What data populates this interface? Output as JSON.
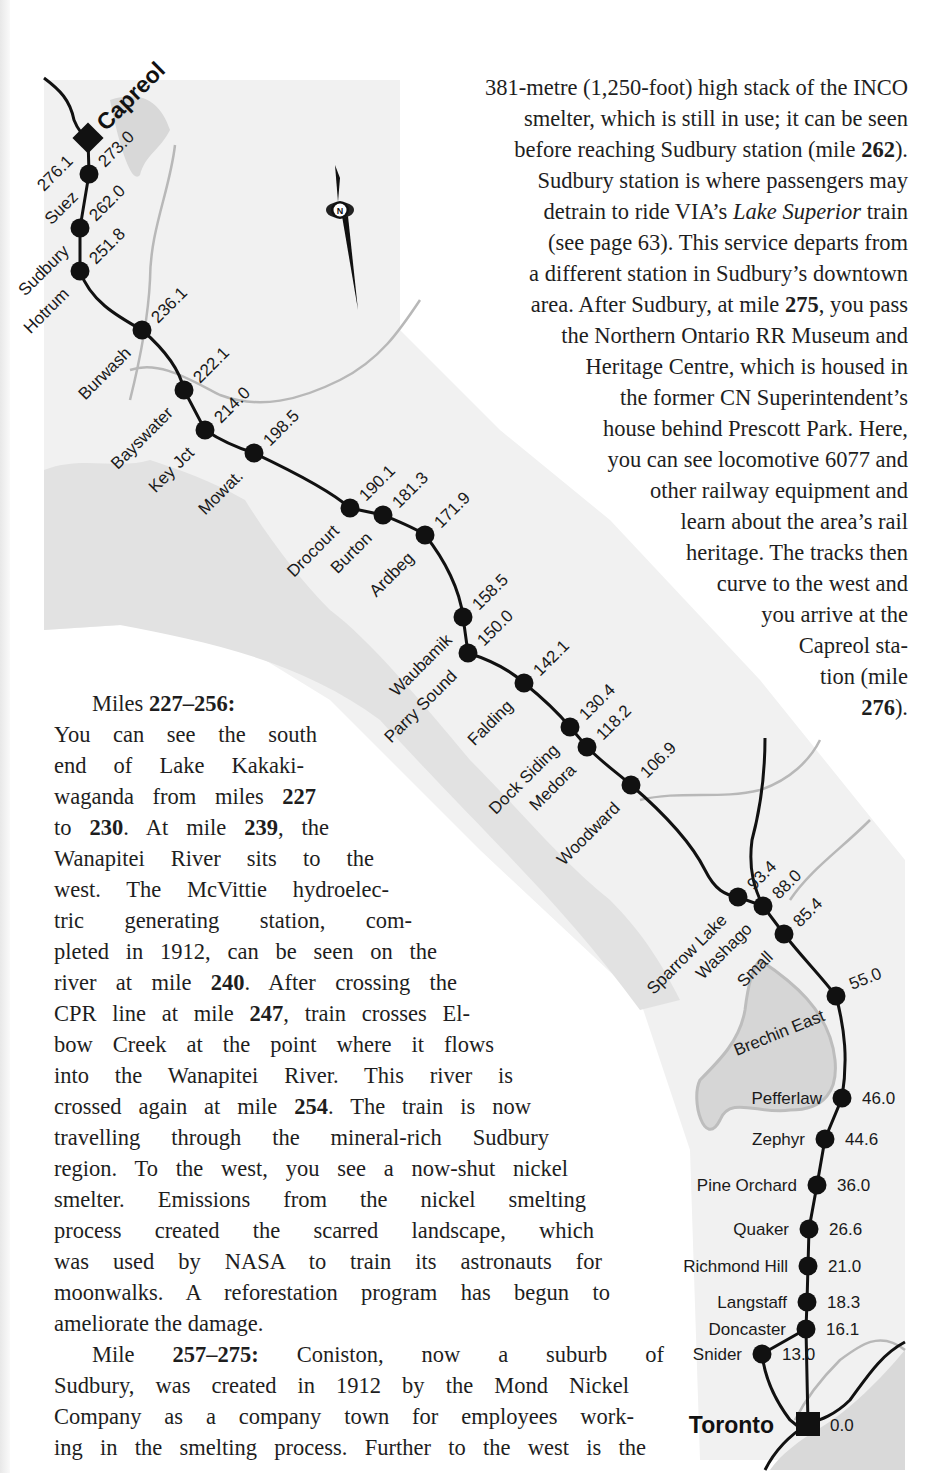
{
  "page": {
    "right_column": {
      "lines": [
        "381-metre (1,250-foot) high stack of the INCO",
        "smelter, which is still in use; it can be seen",
        [
          "before reaching Sudbury station (mile ",
          {
            "b": "262"
          },
          ")."
        ],
        "Sudbury station is where passengers may",
        [
          "detrain to ride VIA’s ",
          {
            "i": "Lake Superior"
          },
          " train"
        ],
        "(see page 63). This service departs from",
        "a different station in Sudbury’s downtown",
        [
          "area. After Sudbury, at mile ",
          {
            "b": "275"
          },
          ", you pass"
        ],
        "the Northern Ontario RR Museum and",
        "Heritage Centre, which is housed in",
        "the former CN Superintendent’s",
        "house behind Prescott Park. Here,",
        "you can see locomotive 6077 and",
        "other railway equipment and",
        "learn about the area’s rail",
        "heritage. The tracks then",
        "curve to the west and",
        "you arrive at the",
        "Capreol sta-",
        "tion (mile",
        [
          {
            "b": "276"
          },
          ")."
        ]
      ]
    },
    "left_column": {
      "lines": [
        {
          "indent": true,
          "parts": [
            "Miles ",
            {
              "b": "227–256:"
            }
          ],
          "last": true
        },
        {
          "parts": [
            "You can see the south"
          ],
          "width": 263
        },
        {
          "parts": [
            "end of Lake Kakaki-"
          ],
          "width": 250
        },
        {
          "parts": [
            "waganda from miles ",
            {
              "b": "227"
            }
          ],
          "width": 262
        },
        {
          "parts": [
            "to ",
            {
              "b": "230"
            },
            ". At mile ",
            {
              "b": "239"
            },
            ", the"
          ],
          "width": 275
        },
        {
          "parts": [
            "Wanapitei River sits to the"
          ],
          "width": 320
        },
        {
          "parts": [
            "west. The McVittie hydroelec-"
          ],
          "width": 335
        },
        {
          "parts": [
            "tric generating station, com-"
          ],
          "width": 358
        },
        {
          "parts": [
            "pleted in 1912, can be seen on the"
          ],
          "width": 383
        },
        {
          "parts": [
            "river at mile ",
            {
              "b": "240"
            },
            ". After crossing the"
          ],
          "width": 403
        },
        {
          "parts": [
            "CPR line at mile ",
            {
              "b": "247"
            },
            ", train crosses El-"
          ],
          "width": 416
        },
        {
          "parts": [
            "bow Creek at the point where it flows"
          ],
          "width": 440
        },
        {
          "parts": [
            "into the Wanapitei River. This river is"
          ],
          "width": 459
        },
        {
          "parts": [
            "crossed again at mile ",
            {
              "b": "254"
            },
            ". The train is now"
          ],
          "width": 477
        },
        {
          "parts": [
            "travelling through the mineral-rich Sudbury"
          ],
          "width": 495
        },
        {
          "parts": [
            "region. To the west, you see a now-shut nickel"
          ],
          "width": 514
        },
        {
          "parts": [
            "smelter. Emissions from the nickel smelting"
          ],
          "width": 532
        },
        {
          "parts": [
            "process created the scarred landscape, which"
          ],
          "width": 540
        },
        {
          "parts": [
            "was used by NASA to train its astronauts for"
          ],
          "width": 548
        },
        {
          "parts": [
            "moonwalks. A reforestation program has begun to"
          ],
          "width": 556
        },
        {
          "parts": [
            "ameliorate the damage."
          ],
          "last": true
        },
        {
          "indent": true,
          "parts": [
            "Mile ",
            {
              "b": "257–275:"
            },
            " Coniston, now a suburb of"
          ],
          "width": 572
        },
        {
          "parts": [
            "Sudbury, was created in 1912 by the Mond Nickel"
          ],
          "width": 575
        },
        {
          "parts": [
            "Company as a company town for employees work-"
          ],
          "width": 580
        },
        {
          "parts": [
            "ing in the smelting process. Further to the west is the"
          ],
          "width": 592
        }
      ]
    }
  },
  "map": {
    "colors": {
      "track": "#111111",
      "land_shade": "#e4e4e4",
      "water": "#d0d0d0",
      "river": "#b5b5b5",
      "band": "#f2f2f2"
    },
    "compass": {
      "label": "N",
      "x": 340,
      "y": 210
    },
    "terminals": [
      {
        "name": "Capreol",
        "mile": "276.1",
        "x": 88,
        "y": 138
      },
      {
        "name": "Toronto",
        "mile": "0.0",
        "x": 808,
        "y": 1424
      }
    ],
    "stations": [
      {
        "name": "Suez",
        "mile": "273.0",
        "x": 89,
        "y": 174,
        "angle": -45
      },
      {
        "name": "Sudbury",
        "mile": "262.0",
        "x": 80,
        "y": 228,
        "angle": -45
      },
      {
        "name": "Hotrum",
        "mile": "251.8",
        "x": 80,
        "y": 271,
        "angle": -45
      },
      {
        "name": "Burwash",
        "mile": "236.1",
        "x": 142,
        "y": 330,
        "angle": -45
      },
      {
        "name": "Bayswater",
        "mile": "222.1",
        "x": 184,
        "y": 390,
        "angle": -45
      },
      {
        "name": "Key Jct",
        "mile": "214.0",
        "x": 205,
        "y": 430,
        "angle": -45
      },
      {
        "name": "Mowat.",
        "mile": "198.5",
        "x": 254,
        "y": 453,
        "angle": -45
      },
      {
        "name": "Drocourt",
        "mile": "190.1",
        "x": 350,
        "y": 508,
        "angle": -45
      },
      {
        "name": "Burton",
        "mile": "181.3",
        "x": 383,
        "y": 515,
        "angle": -45
      },
      {
        "name": "Ardbeg",
        "mile": "171.9",
        "x": 425,
        "y": 535,
        "angle": -45
      },
      {
        "name": "Waubamik",
        "mile": "158.5",
        "x": 463,
        "y": 617,
        "angle": -45
      },
      {
        "name": "Parry Sound",
        "mile": "150.0",
        "x": 468,
        "y": 653,
        "angle": -45
      },
      {
        "name": "Falding",
        "mile": "142.1",
        "x": 524,
        "y": 683,
        "angle": -45
      },
      {
        "name": "Dock Siding",
        "mile": "130.4",
        "x": 570,
        "y": 727,
        "angle": -45
      },
      {
        "name": "Medora",
        "mile": "118.2",
        "x": 587,
        "y": 747,
        "angle": -45
      },
      {
        "name": "Woodward",
        "mile": "106.9",
        "x": 631,
        "y": 785,
        "angle": -45
      },
      {
        "name": "Sparrow Lake",
        "mile": "93.4",
        "x": 738,
        "y": 897,
        "angle": -45
      },
      {
        "name": "Washago",
        "mile": "88.0",
        "x": 763,
        "y": 906,
        "angle": -45
      },
      {
        "name": "Small",
        "mile": "85.4",
        "x": 784,
        "y": 934,
        "angle": -45
      },
      {
        "name": "Brechin East",
        "mile": "55.0",
        "x": 836,
        "y": 996,
        "angle": -22
      },
      {
        "name": "Pefferlaw",
        "mile": "46.0",
        "x": 842,
        "y": 1098,
        "angle": 0
      },
      {
        "name": "Zephyr",
        "mile": "44.6",
        "x": 825,
        "y": 1139,
        "angle": 0
      },
      {
        "name": "Pine Orchard",
        "mile": "36.0",
        "x": 817,
        "y": 1185,
        "angle": 0
      },
      {
        "name": "Quaker",
        "mile": "26.6",
        "x": 809,
        "y": 1229,
        "angle": 0
      },
      {
        "name": "Richmond Hill",
        "mile": "21.0",
        "x": 808,
        "y": 1266,
        "angle": 0
      },
      {
        "name": "Langstaff",
        "mile": "18.3",
        "x": 807,
        "y": 1302,
        "angle": 0
      },
      {
        "name": "Doncaster",
        "mile": "16.1",
        "x": 806,
        "y": 1329,
        "angle": 0
      },
      {
        "name": "Snider",
        "mile": "13.0",
        "x": 762,
        "y": 1354,
        "angle": 0
      }
    ]
  }
}
